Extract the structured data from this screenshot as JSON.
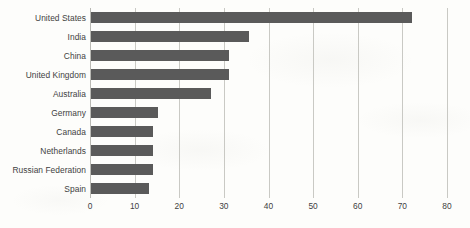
{
  "chart_data": {
    "type": "bar",
    "orientation": "horizontal",
    "title": "",
    "subtitle": "",
    "xlabel": "",
    "ylabel": "",
    "xlim": [
      0,
      80
    ],
    "xticks": [
      0,
      10,
      20,
      30,
      40,
      50,
      60,
      70,
      80
    ],
    "xtick_labels": [
      "0",
      "10",
      "20",
      "30",
      "40",
      "50",
      "60",
      "70",
      "80"
    ],
    "grid": "vertical",
    "legend": "none",
    "bar_color": "#5a5a5a",
    "gridline_color": "#c9c9c4",
    "text_color": "#3f3f3f",
    "categories": [
      "United States",
      "India",
      "China",
      "United Kingdom",
      "Australia",
      "Germany",
      "Canada",
      "Netherlands",
      "Russian Federation",
      "Spain"
    ],
    "values": [
      72,
      35.5,
      31,
      31,
      27,
      15,
      13.8,
      13.8,
      13.8,
      12.9
    ]
  }
}
